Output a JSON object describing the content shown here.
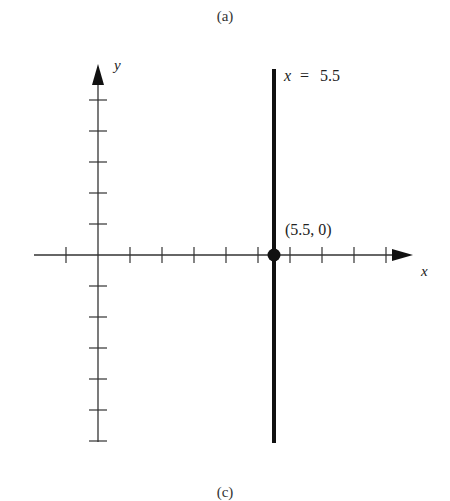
{
  "captions": {
    "top": "(a)",
    "bottom": "(c)"
  },
  "axes": {
    "x_label": "x",
    "y_label": "y",
    "origin_px": [
      98,
      255
    ],
    "unit_px_x": 32,
    "unit_px_y": 31,
    "x_ticks": [
      -1,
      1,
      2,
      3,
      4,
      5,
      6,
      7,
      8,
      9
    ],
    "y_ticks": [
      -6,
      -5,
      -4,
      -3,
      -2,
      -1,
      1,
      2,
      3,
      4,
      5
    ]
  },
  "line": {
    "equation_lhs": "x",
    "equation_eq": "=",
    "equation_rhs": "5.5",
    "x_value": 5.5,
    "color": "#111111"
  },
  "point": {
    "label": "(5.5, 0)",
    "x": 5.5,
    "y": 0,
    "color": "#111111"
  },
  "chart_data": {
    "type": "line",
    "title": "",
    "subtitle": "(a)",
    "xlabel": "x",
    "ylabel": "y",
    "series": [
      {
        "name": "x = 5.5",
        "kind": "vertical-line",
        "x": [
          5.5,
          5.5
        ],
        "y": [
          6,
          -6
        ]
      }
    ],
    "points": [
      {
        "label": "(5.5, 0)",
        "x": 5.5,
        "y": 0
      }
    ],
    "xlim": [
      -2,
      10
    ],
    "ylim": [
      -6,
      6
    ],
    "x_ticks": [
      -1,
      1,
      2,
      3,
      4,
      5,
      6,
      7,
      8,
      9
    ],
    "y_ticks": [
      -6,
      -5,
      -4,
      -3,
      -2,
      -1,
      1,
      2,
      3,
      4,
      5
    ],
    "grid": false,
    "legend": "none"
  }
}
